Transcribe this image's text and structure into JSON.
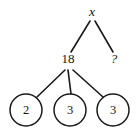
{
  "diagram": {
    "type": "factor-tree",
    "background_color": "#ffffff",
    "stroke_color": "#1a1a1a",
    "text_color": "#151515",
    "nodes": {
      "root": {
        "label": "x",
        "style": "italic",
        "x": 92,
        "y": 13
      },
      "left_child": {
        "label": "18",
        "style": "roman",
        "x": 68,
        "y": 60
      },
      "right_child": {
        "label": "?",
        "style": "italic",
        "x": 114,
        "y": 60
      }
    },
    "leaves": [
      {
        "label": "2",
        "cx": 26,
        "cy": 110,
        "r": 16
      },
      {
        "label": "3",
        "cx": 70,
        "cy": 110,
        "r": 16
      },
      {
        "label": "3",
        "cx": 113,
        "cy": 110,
        "r": 16
      }
    ],
    "edges": [
      {
        "name": "root-to-18",
        "x1": 90,
        "y1": 21,
        "x2": 71,
        "y2": 52
      },
      {
        "name": "root-to-unknown",
        "x1": 95,
        "y1": 21,
        "x2": 113,
        "y2": 52
      },
      {
        "name": "18-to-leaf-2",
        "x1": 65,
        "y1": 70,
        "x2": 37,
        "y2": 97
      },
      {
        "name": "18-to-leaf-3-middle",
        "x1": 68,
        "y1": 70,
        "x2": 71,
        "y2": 94
      },
      {
        "name": "18-to-leaf-3-right",
        "x1": 73,
        "y1": 70,
        "x2": 103,
        "y2": 97
      }
    ]
  }
}
